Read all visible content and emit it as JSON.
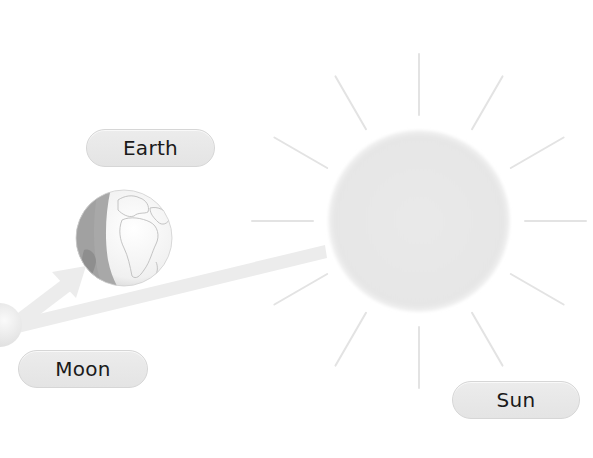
{
  "diagram": {
    "type": "sun-earth-moon",
    "labels": {
      "earth": "Earth",
      "moon": "Moon",
      "sun": "Sun"
    },
    "bodies": {
      "sun": {
        "cx": 419,
        "cy": 221,
        "r": 91,
        "fill": "#e8e8e8",
        "rays": 12,
        "ray_inner_r": 106,
        "ray_outer_r": 167,
        "ray_color": "#e2e2e2"
      },
      "earth": {
        "cx": 124,
        "cy": 238,
        "r": 48,
        "day_fill": "#f4f4f4",
        "night_fill": "#a9a9a9"
      },
      "moon": {
        "cx": 0,
        "cy": 325,
        "r": 22,
        "fill": "#ededed"
      }
    },
    "connectors": [
      {
        "from": "moon",
        "to": "sun",
        "style": "band",
        "color": "#ececec"
      },
      {
        "from": "moon",
        "to": "earth",
        "style": "arrow",
        "color": "#ececec"
      }
    ]
  }
}
